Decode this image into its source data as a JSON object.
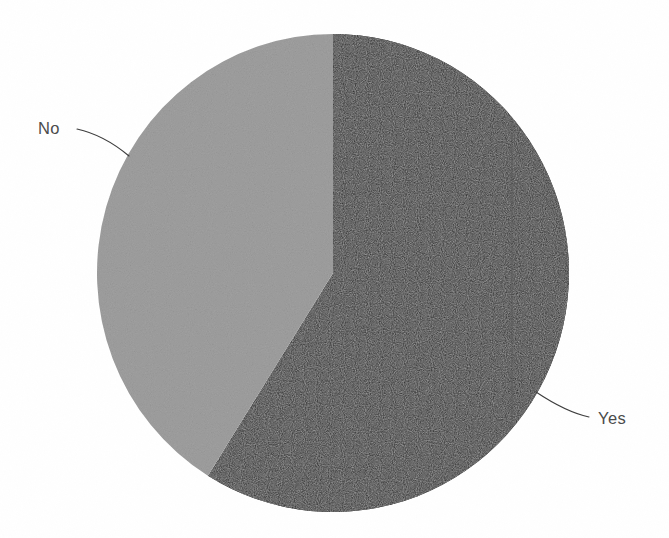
{
  "figure": {
    "width": 669,
    "height": 538,
    "background_color": "#ffffff"
  },
  "chart_data": {
    "type": "pie",
    "title": "",
    "subtitle": "",
    "xlabel": "",
    "ylabel": "",
    "grid": false,
    "legend_position": "none",
    "label_style": "outside-with-leader-lines",
    "start_angle_deg": 0,
    "direction": "clockwise",
    "categories": [
      "Yes",
      "No"
    ],
    "values": [
      59,
      41
    ],
    "value_unit": "percent",
    "slices": [
      {
        "label": "Yes",
        "value": 59,
        "percent": 59,
        "angle_deg": 212,
        "start_angle_deg": 0,
        "end_angle_deg": 212,
        "color": "#1a1a1a"
      },
      {
        "label": "No",
        "value": 41,
        "percent": 41,
        "angle_deg": 148,
        "start_angle_deg": 212,
        "end_angle_deg": 360,
        "color": "#c8c8c8"
      }
    ],
    "colors": [
      "#1a1a1a",
      "#c8c8c8"
    ],
    "geometry": {
      "center_x": 333,
      "center_y": 273,
      "radius_x": 236,
      "radius_y": 239
    },
    "annotations": [
      {
        "text": "No",
        "text_x": 38,
        "text_y": 134,
        "leader_from_x": 77,
        "leader_from_y": 129,
        "leader_ctrl_x": 104,
        "leader_ctrl_y": 135,
        "leader_to_x": 129,
        "leader_to_y": 156
      },
      {
        "text": "Yes",
        "text_x": 598,
        "text_y": 424,
        "leader_from_x": 536,
        "leader_from_y": 392,
        "leader_ctrl_x": 566,
        "leader_ctrl_y": 412,
        "leader_to_x": 589,
        "leader_to_y": 417
      }
    ]
  },
  "labels": {
    "no": "No",
    "yes": "Yes"
  }
}
